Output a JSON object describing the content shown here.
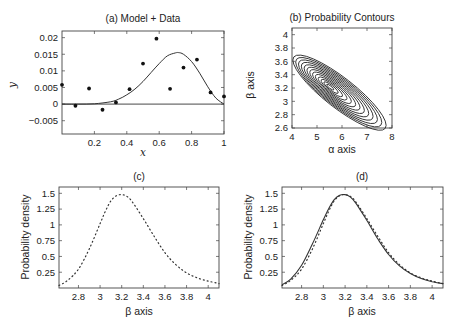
{
  "chart_data": [
    {
      "id": "a",
      "type": "scatter",
      "title": "(a) Model + Data",
      "xlabel": "x",
      "ylabel": "y",
      "xlim": [
        0,
        1
      ],
      "ylim": [
        -0.009,
        0.022
      ],
      "xticks": [
        0.2,
        0.4,
        0.6,
        0.8,
        1
      ],
      "xtick_labels": [
        "0.2",
        "0.4",
        "0.6",
        "0.8",
        "1"
      ],
      "yticks": [
        -0.005,
        0,
        0.005,
        0.01,
        0.015,
        0.02
      ],
      "ytick_labels": [
        "-0.005",
        "0",
        "0.005",
        "0.01",
        "0.015",
        "0.02"
      ],
      "grid": false,
      "series": [
        {
          "name": "Data",
          "style": "points",
          "x": [
            0.0,
            0.083,
            0.167,
            0.25,
            0.333,
            0.417,
            0.5,
            0.583,
            0.667,
            0.75,
            0.833,
            0.917,
            1.0
          ],
          "y": [
            0.0058,
            -0.0005,
            0.0047,
            -0.0017,
            0.0005,
            0.0045,
            0.0122,
            0.0197,
            0.0046,
            0.011,
            0.0134,
            0.0035,
            0.0023
          ]
        },
        {
          "name": "Model",
          "style": "line",
          "x": [
            0,
            0.1,
            0.2,
            0.3,
            0.35,
            0.4,
            0.45,
            0.5,
            0.55,
            0.6,
            0.65,
            0.7,
            0.72,
            0.75,
            0.8,
            0.85,
            0.9,
            0.95,
            1.0
          ],
          "y": [
            0,
            0,
            0.0001,
            0.0007,
            0.0015,
            0.0028,
            0.0045,
            0.0068,
            0.0095,
            0.0122,
            0.0145,
            0.0154,
            0.0155,
            0.015,
            0.0128,
            0.0093,
            0.0052,
            0.0018,
            0
          ]
        }
      ],
      "hline": 0
    },
    {
      "id": "b",
      "type": "contour",
      "title": "(b) Probability Contours",
      "xlabel": "α axis",
      "ylabel": "β axis",
      "xlim": [
        4,
        8
      ],
      "ylim": [
        2.6,
        4.1
      ],
      "xticks": [
        4,
        5,
        6,
        7,
        8
      ],
      "xtick_labels": [
        "4",
        "5",
        "6",
        "7",
        "8"
      ],
      "yticks": [
        2.6,
        2.8,
        3.0,
        3.2,
        3.4,
        3.6,
        3.8,
        4.0
      ],
      "ytick_labels": [
        "2.6",
        "2.8",
        "3",
        "3.2",
        "3.4",
        "3.6",
        "3.8",
        "4"
      ],
      "peak": {
        "alpha": 5.5,
        "beta": 3.22
      },
      "contour_levels": 13,
      "outer_extent": {
        "alpha": [
          4.45,
          7.6
        ],
        "beta": [
          2.73,
          4.02
        ]
      },
      "grid": false
    },
    {
      "id": "c",
      "type": "line",
      "title": "(c)",
      "xlabel": "β axis",
      "ylabel": "Probability density",
      "xlim": [
        2.62,
        4.1
      ],
      "ylim": [
        0,
        1.6
      ],
      "xticks": [
        2.8,
        3.0,
        3.2,
        3.4,
        3.6,
        3.8,
        4.0
      ],
      "xtick_labels": [
        "2.8",
        "3",
        "3.2",
        "3.4",
        "3.6",
        "3.8",
        "4"
      ],
      "yticks": [
        0.25,
        0.5,
        0.75,
        1.0,
        1.25,
        1.5
      ],
      "ytick_labels": [
        "0.25",
        "0.5",
        "0.75",
        "1",
        "1.25",
        "1.5"
      ],
      "grid": false,
      "series": [
        {
          "name": "Marginal density (dotted)",
          "style": "dotted",
          "x": [
            2.62,
            2.7,
            2.8,
            2.9,
            3.0,
            3.05,
            3.1,
            3.15,
            3.2,
            3.25,
            3.3,
            3.4,
            3.5,
            3.6,
            3.7,
            3.8,
            3.9,
            4.0,
            4.1
          ],
          "y": [
            0.04,
            0.12,
            0.3,
            0.62,
            1.02,
            1.22,
            1.38,
            1.46,
            1.48,
            1.45,
            1.36,
            1.1,
            0.82,
            0.56,
            0.37,
            0.24,
            0.16,
            0.11,
            0.07
          ]
        }
      ]
    },
    {
      "id": "d",
      "type": "line",
      "title": "(d)",
      "xlabel": "β axis",
      "ylabel": "Probability density",
      "xlim": [
        2.62,
        4.1
      ],
      "ylim": [
        0,
        1.6
      ],
      "xticks": [
        2.8,
        3.0,
        3.2,
        3.4,
        3.6,
        3.8,
        4.0
      ],
      "xtick_labels": [
        "2.8",
        "3",
        "3.2",
        "3.4",
        "3.6",
        "3.8",
        "4"
      ],
      "yticks": [
        0.25,
        0.5,
        0.75,
        1.0,
        1.25,
        1.5
      ],
      "ytick_labels": [
        "0.25",
        "0.5",
        "0.75",
        "1",
        "1.25",
        "1.5"
      ],
      "grid": false,
      "series": [
        {
          "name": "Approximation (solid)",
          "style": "solid",
          "x": [
            2.62,
            2.7,
            2.8,
            2.9,
            3.0,
            3.05,
            3.1,
            3.15,
            3.2,
            3.25,
            3.3,
            3.4,
            3.5,
            3.6,
            3.7,
            3.8,
            3.9,
            4.0,
            4.1
          ],
          "y": [
            0.05,
            0.14,
            0.36,
            0.7,
            1.08,
            1.26,
            1.4,
            1.47,
            1.48,
            1.44,
            1.34,
            1.07,
            0.78,
            0.53,
            0.35,
            0.23,
            0.15,
            0.1,
            0.07
          ]
        },
        {
          "name": "Exact marginal (dotted)",
          "style": "dotted",
          "x": [
            2.62,
            2.7,
            2.8,
            2.9,
            3.0,
            3.05,
            3.1,
            3.15,
            3.2,
            3.25,
            3.3,
            3.4,
            3.5,
            3.6,
            3.7,
            3.8,
            3.9,
            4.0,
            4.1
          ],
          "y": [
            0.04,
            0.12,
            0.3,
            0.62,
            1.02,
            1.22,
            1.38,
            1.46,
            1.48,
            1.45,
            1.36,
            1.1,
            0.82,
            0.56,
            0.37,
            0.24,
            0.16,
            0.11,
            0.07
          ]
        }
      ]
    }
  ],
  "layout": {
    "frames": {
      "a": {
        "left": 62,
        "top": 31,
        "right": 224,
        "bottom": 134
      },
      "b": {
        "left": 292,
        "top": 28,
        "right": 392,
        "bottom": 128
      },
      "c": {
        "left": 59,
        "top": 187,
        "right": 219,
        "bottom": 288
      },
      "d": {
        "left": 282,
        "top": 187,
        "right": 443,
        "bottom": 288
      }
    },
    "colors": {
      "ink": "#222222",
      "frame": "#444444",
      "background": "#ffffff"
    }
  }
}
